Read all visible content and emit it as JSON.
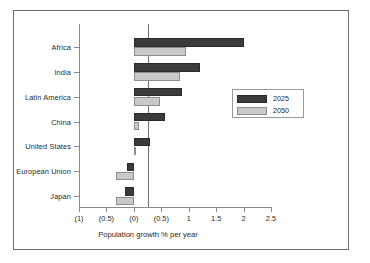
{
  "chart_data": {
    "type": "bar",
    "orientation": "horizontal",
    "title": "",
    "subtitle": "",
    "xlabel": "Population growth % per year",
    "ylabel": "",
    "categories": [
      "Africa",
      "India",
      "Latin America",
      "China",
      "United States",
      "European Union",
      "Japan"
    ],
    "series": [
      {
        "name": "2025",
        "color": "#3b3b3b",
        "values": [
          2.0,
          1.2,
          0.87,
          0.57,
          0.3,
          -0.13,
          -0.16
        ]
      },
      {
        "name": "2050",
        "color": "#c9c9c9",
        "values": [
          0.95,
          0.84,
          0.47,
          0.1,
          0.01,
          -0.32,
          -0.33
        ]
      }
    ],
    "xlim": [
      -1.0,
      2.5
    ],
    "xticks": [
      -1.0,
      -0.5,
      0.0,
      0.5,
      1.0,
      1.5,
      2.0,
      2.5
    ],
    "xtick_labels": [
      "(1)",
      "(0.5)",
      "(0)",
      "(0.5)",
      "1",
      "1.5",
      "2",
      "2.5"
    ],
    "grid": false,
    "legend_position": "center-right",
    "note": "Values in parentheses on the axis denote negative numbers."
  },
  "legend": {
    "entries": [
      {
        "label": "2025",
        "swatch": "dark-swatch"
      },
      {
        "label": "2050",
        "swatch": "light-swatch"
      }
    ]
  },
  "axis": {
    "x_title": "Population growth % per year"
  }
}
